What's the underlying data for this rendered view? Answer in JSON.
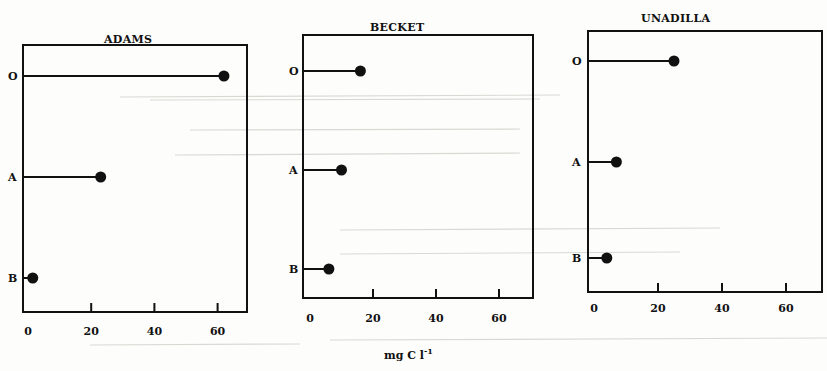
{
  "chart_data": [
    {
      "type": "lollipop",
      "title": "ADAMS",
      "categories": [
        "O",
        "A",
        "B"
      ],
      "values": [
        62,
        23,
        1.5
      ],
      "xlabel": "",
      "ylabel": "",
      "xticks": [
        "0",
        "20",
        "40",
        "60"
      ],
      "xlim": [
        0,
        70
      ],
      "grid": false
    },
    {
      "type": "lollipop",
      "title": "BECKET",
      "categories": [
        "O",
        "A",
        "B"
      ],
      "values": [
        16,
        10,
        6
      ],
      "xlabel": "mg C l-1",
      "ylabel": "",
      "xticks": [
        "0",
        "20",
        "40",
        "60"
      ],
      "xlim": [
        0,
        70
      ],
      "grid": false
    },
    {
      "type": "lollipop",
      "title": "UNADILLA",
      "categories": [
        "O",
        "A",
        "B"
      ],
      "values": [
        25,
        7,
        4
      ],
      "xlabel": "",
      "ylabel": "",
      "xticks": [
        "0",
        "20",
        "40",
        "60"
      ],
      "xlim": [
        0,
        70
      ],
      "grid": false
    }
  ],
  "shared_xlabel": {
    "base": "mg C l",
    "exponent": "-1"
  },
  "panels": [
    {
      "title": "ADAMS"
    },
    {
      "title": "BECKET"
    },
    {
      "title": "UNADILLA"
    }
  ]
}
